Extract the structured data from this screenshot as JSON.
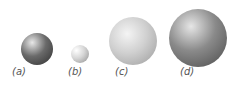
{
  "spheres": [
    {
      "id": "a",
      "label": "(a)",
      "cx": 37,
      "cy": 49,
      "r": 16,
      "light": "#e8e8e8",
      "mid": "#6a6a6a",
      "dark": "#2e2e2e",
      "hl": [
        35,
        30
      ]
    },
    {
      "id": "b",
      "label": "(b)",
      "cx": 80,
      "cy": 54,
      "r": 9,
      "light": "#ffffff",
      "mid": "#d6d6d6",
      "dark": "#8e8e8e",
      "hl": [
        30,
        30
      ]
    },
    {
      "id": "c",
      "label": "(c)",
      "cx": 133,
      "cy": 41,
      "r": 24,
      "light": "#f4f4f4",
      "mid": "#d0d0d0",
      "dark": "#9a9a9a",
      "hl": [
        38,
        35
      ]
    },
    {
      "id": "d",
      "label": "(d)",
      "cx": 198,
      "cy": 38,
      "r": 29,
      "light": "#e6e6e6",
      "mid": "#8a8a8a",
      "dark": "#4a4a4a",
      "hl": [
        38,
        30
      ]
    }
  ],
  "label_positions": {
    "a": [
      12,
      72
    ],
    "b": [
      67,
      72
    ],
    "c": [
      115,
      72
    ],
    "d": [
      180,
      72
    ]
  }
}
